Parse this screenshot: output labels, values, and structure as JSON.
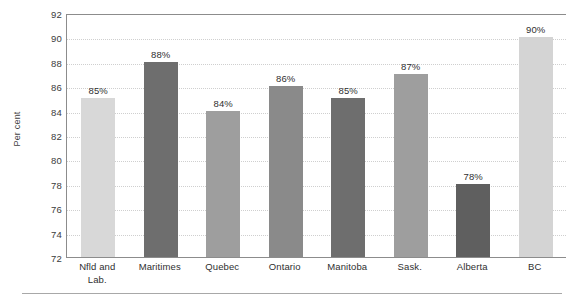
{
  "chart_data": {
    "type": "bar",
    "title": "",
    "subtitle": "",
    "xlabel": "",
    "ylabel": "Per cent",
    "ylim": [
      72,
      92
    ],
    "ytick_step": 2,
    "yticks": [
      92,
      90,
      88,
      86,
      84,
      82,
      80,
      78,
      76,
      74,
      72
    ],
    "grid": true,
    "grid_style": "dotted-horizontal",
    "legend": "none",
    "categories": [
      "Nfld and Lab.",
      "Maritimes",
      "Quebec",
      "Ontario",
      "Manitoba",
      "Sask.",
      "Alberta",
      "BC"
    ],
    "values": [
      85,
      88,
      84,
      86,
      85,
      87,
      78,
      90
    ],
    "data_labels": [
      "85%",
      "88%",
      "84%",
      "86%",
      "85%",
      "87%",
      "78%",
      "90%"
    ],
    "bar_colors": [
      "#d8d8d8",
      "#6e6e6e",
      "#9e9e9e",
      "#8a8a8a",
      "#6e6e6e",
      "#9e9e9e",
      "#5f5f5f",
      "#d4d4d4"
    ]
  },
  "axis": {
    "y_title": "Per cent",
    "y_tick_labels": [
      "92",
      "90",
      "88",
      "86",
      "84",
      "82",
      "80",
      "78",
      "76",
      "74",
      "72"
    ],
    "x_tick_labels": [
      {
        "line1": "Nfld and",
        "line2": "Lab."
      },
      {
        "line1": "Maritimes",
        "line2": ""
      },
      {
        "line1": "Quebec",
        "line2": ""
      },
      {
        "line1": "Ontario",
        "line2": ""
      },
      {
        "line1": "Manitoba",
        "line2": ""
      },
      {
        "line1": "Sask.",
        "line2": ""
      },
      {
        "line1": "Alberta",
        "line2": ""
      },
      {
        "line1": "BC",
        "line2": ""
      }
    ]
  },
  "colors": {
    "axis_line": "#8c8c8c",
    "gridline": "#cfcfcf",
    "label_text": "#2f2f2f",
    "rule": "#a8a8a8",
    "background": "#ffffff"
  }
}
